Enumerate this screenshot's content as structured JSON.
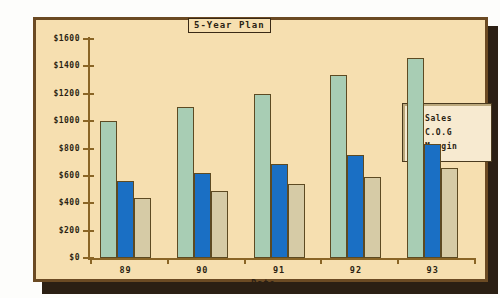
{
  "chart_data": {
    "type": "bar",
    "title": "5-Year Plan",
    "xlabel": "Date",
    "ylabel": "",
    "categories": [
      "89",
      "90",
      "91",
      "92",
      "93"
    ],
    "series": [
      {
        "name": "Sales",
        "values": [
          1000,
          1105,
          1200,
          1340,
          1460
        ],
        "color": "#a8cdb4"
      },
      {
        "name": "C.O.G",
        "values": [
          560,
          620,
          690,
          755,
          835
        ],
        "color": "#1a6fc4"
      },
      {
        "name": "Margin",
        "values": [
          440,
          490,
          540,
          595,
          660
        ],
        "color": "#d6cba6"
      }
    ],
    "ylim": [
      0,
      1600
    ],
    "ytick_values": [
      0,
      200,
      400,
      600,
      800,
      1000,
      1200,
      1400,
      1600
    ],
    "ytick_labels": [
      "$0",
      "$200",
      "$400",
      "$600",
      "$800",
      "$1000",
      "$1200",
      "$1400",
      "$1600"
    ],
    "grid": false,
    "legend_position": "right-inside"
  },
  "legend": {
    "entries": [
      {
        "label": "Sales",
        "color": "#a8cdb4"
      },
      {
        "label": "C.O.G",
        "color": "#1a6fc4"
      },
      {
        "label": "Margin",
        "color": "#d6cba6"
      }
    ]
  },
  "colors": {
    "panel_background": "#f6dfb0",
    "panel_border": "#6b4a23",
    "axis": "#8a6526",
    "text": "#2b1f13",
    "shadow": "#2b1f13",
    "page_background": "#fdfdfb",
    "series_sales": "#a8cdb4",
    "series_cog": "#1a6fc4",
    "series_margin": "#d6cba6"
  }
}
